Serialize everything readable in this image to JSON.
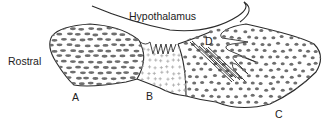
{
  "labels": {
    "top": "Hypothalamus",
    "left": "Rostral",
    "a": "A",
    "b": "B",
    "c": "C",
    "d": "D"
  },
  "regions": [
    {
      "id": "A",
      "pattern": "oval-dashes"
    },
    {
      "id": "B",
      "pattern": "plus-signs"
    },
    {
      "id": "C",
      "pattern": "dots"
    },
    {
      "id": "D",
      "pattern": "parallel-fiber-lines"
    }
  ],
  "colors": {
    "stroke": "#2a2a2a",
    "fill_mark": "#6e6e6e",
    "plus": "#a8a8a8",
    "background": "#ffffff"
  }
}
